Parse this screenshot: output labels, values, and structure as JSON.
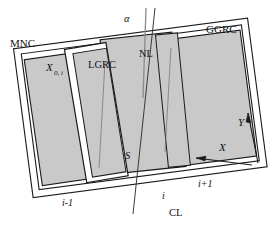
{
  "diagram": {
    "title_hidden": "",
    "colors": {
      "panel_fill": "#c9c9c9",
      "frame_fill": "#ffffff",
      "stroke": "#1a1a1a",
      "centerline": "#4d4d4d",
      "background": "#ffffff"
    },
    "labels": {
      "mnc": "MNC",
      "ggrc": "GGRC",
      "lgrc": "LGRC",
      "nl": "NL",
      "s": "S",
      "x0i": "X",
      "x0i_sub": "0, i",
      "alpha": "α",
      "axis_x": "X",
      "axis_y": "Y",
      "cl": "CL",
      "station_prev": "i-1",
      "station_curr": "i",
      "station_next": "i+1"
    }
  }
}
